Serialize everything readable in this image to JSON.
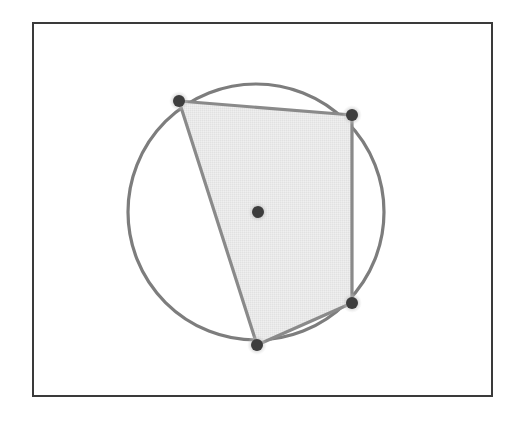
{
  "figure": {
    "type": "geometry-diagram",
    "canvas": {
      "width": 515,
      "height": 423,
      "background": "#ffffff"
    },
    "frame": {
      "name": "outer-border",
      "x": 33,
      "y": 23,
      "width": 459,
      "height": 373,
      "stroke": "#3a3a3a",
      "stroke_width": 2,
      "fill": "#ffffff"
    },
    "circle": {
      "label": "circumcircle",
      "cx": 256,
      "cy": 212,
      "r": 128,
      "stroke": "#7d7d7d",
      "stroke_width": 3.2,
      "fill": "none"
    },
    "polygon": {
      "label": "inscribed-quadrilateral",
      "sides": 4,
      "fill": "#e7e7e7",
      "stroke": "#8a8a8a",
      "stroke_width": 3.2,
      "points": "179,101 352,115 352,303 257,345",
      "vertices": [
        {
          "name": "vertex-top-left",
          "x": 179,
          "y": 101
        },
        {
          "name": "vertex-top-right",
          "x": 352,
          "y": 115
        },
        {
          "name": "vertex-bottom-right",
          "x": 352,
          "y": 303
        },
        {
          "name": "vertex-bottom",
          "x": 257,
          "y": 345
        }
      ]
    },
    "center_point": {
      "name": "circle-center-point",
      "x": 258,
      "y": 212
    },
    "point_style": {
      "core_radius": 6,
      "core_fill": "#3d3d3d",
      "halo_radius": 10,
      "halo_fill": "#c9c9c9",
      "halo_opacity": 0.55
    }
  }
}
